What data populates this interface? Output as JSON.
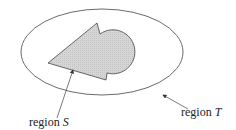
{
  "diagram": {
    "type": "set-region-diagram",
    "outer_region": {
      "label_prefix": "region",
      "label_var": "T",
      "shape": "ellipse"
    },
    "inner_region": {
      "label_prefix": "region",
      "label_var": "S",
      "shape": "notched polygon with circular lobe",
      "fill": "#d4d4d4"
    },
    "colors": {
      "stroke": "#444444",
      "fill_inner": "#d4d4d4",
      "background": "#ffffff",
      "text": "#222222"
    }
  }
}
